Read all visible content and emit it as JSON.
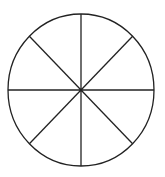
{
  "diagram": {
    "type": "divided-circle",
    "segments": 8,
    "center": [
      81,
      90
    ],
    "rx": 73,
    "ry": 76,
    "stroke_color": "#222222",
    "fill_color": "#ffffff",
    "stroke_width": 1.3
  }
}
